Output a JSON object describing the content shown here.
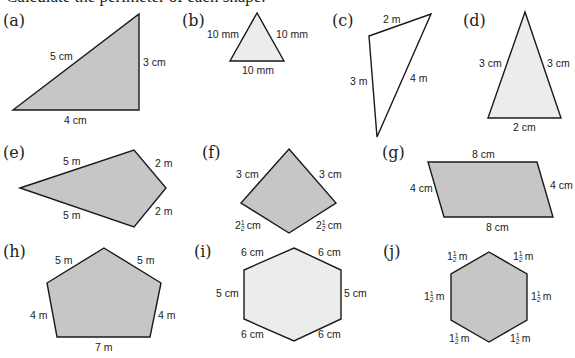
{
  "title": "Calculate the perimeter of each shape.",
  "colors": {
    "dark_fill": "#c6c6c6",
    "light_fill": "#ececec",
    "white_fill": "#ffffff",
    "stroke": "#1a1a1a"
  },
  "shapes": [
    {
      "part": "(a)",
      "type": "right triangle",
      "labels": [
        "5 cm",
        "3 cm",
        "4 cm"
      ]
    },
    {
      "part": "(b)",
      "type": "equilateral triangle",
      "labels": [
        "10 mm",
        "10 mm",
        "10 mm"
      ]
    },
    {
      "part": "(c)",
      "type": "scalene triangle",
      "labels": [
        "2 m",
        "3 m",
        "4 m"
      ]
    },
    {
      "part": "(d)",
      "type": "isosceles triangle",
      "labels": [
        "3 cm",
        "3 cm",
        "2 cm"
      ]
    },
    {
      "part": "(e)",
      "type": "kite",
      "labels": [
        "5 m",
        "2 m",
        "5 m",
        "2 m"
      ]
    },
    {
      "part": "(f)",
      "type": "kite",
      "labels": [
        "3 cm",
        "3 cm",
        "2",
        "cm",
        "2",
        "cm"
      ]
    },
    {
      "part": "(g)",
      "type": "parallelogram",
      "labels": [
        "8 cm",
        "4 cm",
        "4 cm",
        "8 cm"
      ]
    },
    {
      "part": "(h)",
      "type": "pentagon",
      "labels": [
        "5 m",
        "5 m",
        "4 m",
        "4 m",
        "7 m"
      ]
    },
    {
      "part": "(i)",
      "type": "hexagon",
      "labels": [
        "6 cm",
        "6 cm",
        "5 cm",
        "5 cm",
        "6 cm",
        "6 cm"
      ]
    },
    {
      "part": "(j)",
      "type": "regular hexagon",
      "labels": [
        "1",
        "m"
      ]
    }
  ],
  "fraction": {
    "num": "1",
    "den": "2"
  }
}
